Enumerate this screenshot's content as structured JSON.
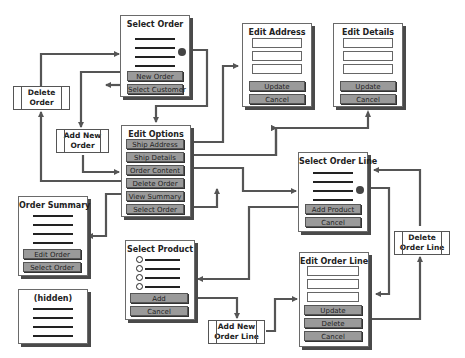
{
  "diagram": {
    "type": "screen-flow",
    "screens": {
      "select_order": {
        "title": "Select Order",
        "buttons": [
          "New Order",
          "Select Customer"
        ]
      },
      "edit_address": {
        "title": "Edit Address",
        "buttons": [
          "Update",
          "Cancel"
        ]
      },
      "edit_details": {
        "title": "Edit Details",
        "buttons": [
          "Update",
          "Cancel"
        ]
      },
      "edit_options": {
        "title": "Edit Options",
        "buttons": [
          "Ship Address",
          "Ship Details",
          "Order Content",
          "Delete Order",
          "View Summary",
          "Select Order"
        ]
      },
      "select_order_line": {
        "title": "Select Order Line",
        "buttons": [
          "Add Product",
          "Cancel"
        ]
      },
      "order_summary": {
        "title": "Order Summary",
        "buttons": [
          "Edit Order",
          "Select Order"
        ]
      },
      "select_product": {
        "title": "Select Product",
        "buttons": [
          "Add",
          "Cancel"
        ]
      },
      "edit_order_line": {
        "title": "Edit Order Line",
        "buttons": [
          "Update",
          "Delete",
          "Cancel"
        ]
      },
      "hidden": {
        "title": "(hidden)"
      }
    },
    "processes": {
      "delete_order": [
        "Delete",
        "Order"
      ],
      "add_new_order": [
        "Add New",
        "Order"
      ],
      "delete_order_line": [
        "Delete",
        "Order Line"
      ],
      "add_new_order_line": [
        "Add New",
        "Order Line"
      ]
    },
    "connector_color": "#555555"
  }
}
